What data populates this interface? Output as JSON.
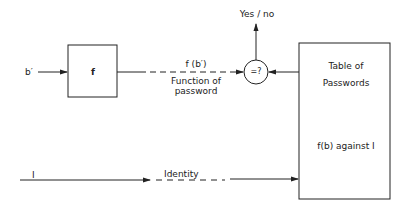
{
  "diagram": {
    "input_label": "b′",
    "function_box_label": "f",
    "function_output_label": "f (b′)",
    "function_output_caption_line1": "Function of",
    "function_output_caption_line2": "password",
    "comparator_label": "=?",
    "result_label": "Yes / no",
    "table_title_line1": "Table of",
    "table_title_line2": "Passwords",
    "table_content": "f(b) against I",
    "identity_input_label": "I",
    "identity_line_label": "Identity",
    "line_color": "#222222"
  }
}
